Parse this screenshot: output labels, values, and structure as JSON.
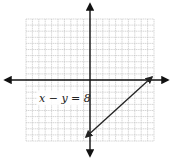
{
  "diagram": {
    "type": "coordinate-plane-graph",
    "equation_label": "x − y = 8",
    "grid": {
      "x_min": -10,
      "x_max": 10,
      "y_min": -10,
      "y_max": 10,
      "step": 1,
      "color": "#b8b8b8"
    },
    "axes": {
      "color": "#111111",
      "arrows": [
        "left",
        "right",
        "up",
        "down"
      ]
    },
    "line": {
      "equation": "x − y = 8",
      "color": "#222222",
      "endpoints_px": [
        [
          86,
          137
        ],
        [
          152,
          77
        ]
      ],
      "arrows_at_both_ends": true
    }
  }
}
